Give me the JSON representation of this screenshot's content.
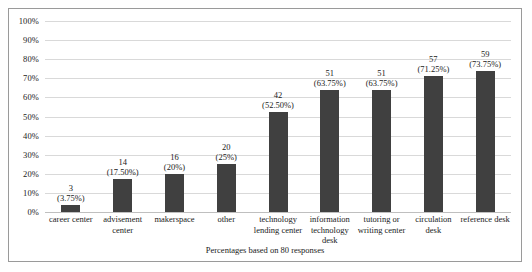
{
  "chart_data": {
    "type": "bar",
    "title": "",
    "xlabel": "",
    "ylabel": "",
    "caption": "Percentages based on 80 responses",
    "ylim": [
      0,
      100
    ],
    "grid": true,
    "legend": "none",
    "total_responses": 80,
    "ytick_labels": [
      "100%",
      "90%",
      "80%",
      "70%",
      "60%",
      "50%",
      "40%",
      "30%",
      "20%",
      "10%",
      "0%"
    ],
    "ytick_values": [
      100,
      90,
      80,
      70,
      60,
      50,
      40,
      30,
      20,
      10,
      0
    ],
    "categories": [
      "career center",
      "advisement center",
      "makerspace",
      "other",
      "technology lending center",
      "information technology desk",
      "tutoring or writing center",
      "circulation desk",
      "reference desk"
    ],
    "values": [
      3,
      14,
      16,
      20,
      42,
      51,
      51,
      57,
      59
    ],
    "percent_values": [
      3.75,
      17.5,
      20,
      25,
      52.5,
      63.75,
      63.75,
      71.25,
      73.75
    ],
    "point_labels": [
      {
        "count": "3",
        "pct": "(3.75%)"
      },
      {
        "count": "14",
        "pct": "(17.50%)"
      },
      {
        "count": "16",
        "pct": "(20%)"
      },
      {
        "count": "20",
        "pct": "(25%)"
      },
      {
        "count": "42",
        "pct": "(52.50%)"
      },
      {
        "count": "51",
        "pct": "(63.75%)"
      },
      {
        "count": "51",
        "pct": "(63.75%)"
      },
      {
        "count": "57",
        "pct": "(71.25%)"
      },
      {
        "count": "59",
        "pct": "(73.75%)"
      }
    ],
    "colors": {
      "bar": "#404040",
      "gridline": "#d9d9d9",
      "baseline": "#bfbfbf",
      "border": "#9a9a9a",
      "background": "#ffffff",
      "text": "#1a1a1a"
    }
  }
}
